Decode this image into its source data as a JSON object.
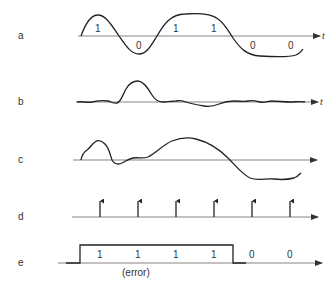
{
  "diagram": {
    "type": "signal-waveform-stages",
    "time_axis_label": "t",
    "rows": [
      {
        "id": "a",
        "label": "a",
        "description": "transmitted analog waveform",
        "bits": [
          "1",
          "0",
          "1",
          "1",
          "0",
          "0"
        ]
      },
      {
        "id": "b",
        "label": "b",
        "description": "noise waveform"
      },
      {
        "id": "c",
        "label": "c",
        "description": "received signal plus noise"
      },
      {
        "id": "d",
        "label": "d",
        "description": "sampling pulses",
        "sample_count": 6
      },
      {
        "id": "e",
        "label": "e",
        "description": "regenerated digital output",
        "bits": [
          "1",
          "1",
          "1",
          "1",
          "0",
          "0"
        ],
        "annotation": "(error)"
      }
    ]
  },
  "labels": {
    "a": "a",
    "b": "b",
    "c": "c",
    "d": "d",
    "e": "e",
    "t": "t",
    "error": "(error)"
  },
  "bits_a": [
    "1",
    "0",
    "1",
    "1",
    "0",
    "0"
  ],
  "bits_e": [
    "1",
    "1",
    "1",
    "1",
    "0",
    "0"
  ],
  "colors": {
    "line": "#222222",
    "axis": "#666666",
    "text": "#333333",
    "background": "#ffffff"
  }
}
